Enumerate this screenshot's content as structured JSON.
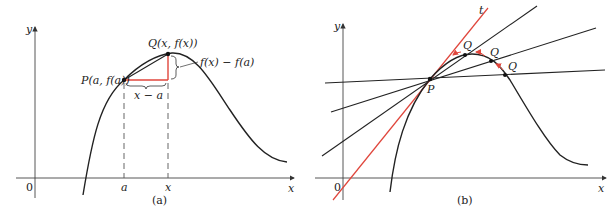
{
  "panels": [
    {
      "id": "a",
      "caption": "(a)",
      "axes": {
        "x_label": "x",
        "y_label": "y",
        "origin_label": "0"
      },
      "points": {
        "P_label": "P(a, f(a))",
        "Q_label": "Q(x, f(x))"
      },
      "annotations": {
        "vertical_brace": "f(x) − f(a)",
        "horizontal_brace": "x − a"
      },
      "ticks": {
        "a": "a",
        "x": "x"
      }
    },
    {
      "id": "b",
      "caption": "(b)",
      "axes": {
        "x_label": "x",
        "y_label": "y",
        "origin_label": "0"
      },
      "points": {
        "P_label": "P",
        "Q_labels": [
          "Q",
          "Q",
          "Q"
        ]
      },
      "tangent_label": "t"
    }
  ],
  "colors": {
    "curve": "#222222",
    "accent": "#e0463c",
    "dash": "#555555"
  }
}
